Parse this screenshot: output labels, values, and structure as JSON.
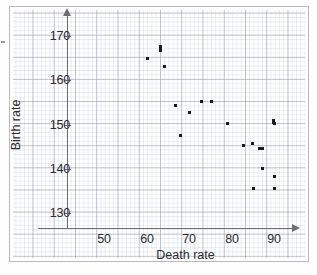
{
  "chart_data": {
    "type": "scatter",
    "title": "",
    "xlabel": "Death rate",
    "ylabel": "Birth rate",
    "xlim": [
      44,
      94
    ],
    "ylim": [
      126,
      174
    ],
    "xticks": [
      50,
      60,
      70,
      80,
      90
    ],
    "yticks": [
      130,
      140,
      150,
      160,
      170
    ],
    "grid": true,
    "minor_grid_step": 1,
    "major_grid_step": 5,
    "legend": "none",
    "series": [
      {
        "name": "Countries",
        "marker": "square",
        "color": "#1b1b1f",
        "points": [
          {
            "x": 60.2,
            "y": 165.0
          },
          {
            "x": 63.4,
            "y": 167.6
          },
          {
            "x": 63.4,
            "y": 166.8
          },
          {
            "x": 64.3,
            "y": 163.0
          },
          {
            "x": 66.8,
            "y": 154.3
          },
          {
            "x": 67.9,
            "y": 147.6
          },
          {
            "x": 70.1,
            "y": 152.8
          },
          {
            "x": 73.0,
            "y": 155.2
          },
          {
            "x": 75.4,
            "y": 155.2
          },
          {
            "x": 79.0,
            "y": 150.2
          },
          {
            "x": 82.8,
            "y": 145.2
          },
          {
            "x": 84.9,
            "y": 145.6
          },
          {
            "x": 85.1,
            "y": 135.5
          },
          {
            "x": 86.5,
            "y": 144.6
          },
          {
            "x": 87.2,
            "y": 144.6
          },
          {
            "x": 87.3,
            "y": 140.1
          },
          {
            "x": 89.9,
            "y": 150.9
          },
          {
            "x": 90.2,
            "y": 150.3
          },
          {
            "x": 90.0,
            "y": 138.3
          },
          {
            "x": 90.0,
            "y": 135.5
          }
        ]
      }
    ]
  },
  "axes": {
    "x_tick_labels": [
      "50",
      "60",
      "70",
      "80",
      "90"
    ],
    "y_tick_labels": [
      "170",
      "160",
      "150",
      "140",
      "130"
    ],
    "x_axis_title": "Death rate",
    "y_axis_title": "Birth rate"
  }
}
